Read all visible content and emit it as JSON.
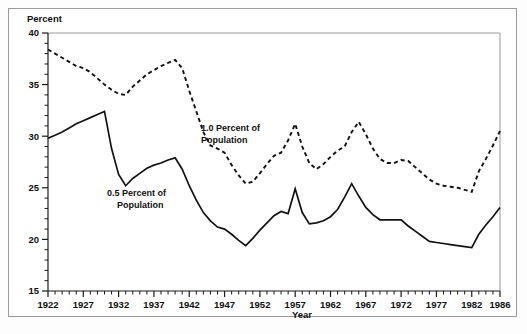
{
  "figure": {
    "y_axis_title": "Percent",
    "x_axis_title": "Year"
  },
  "labels": {
    "series_solid_line1": "0.5 Percent of",
    "series_solid_line2": "Population",
    "series_dashed_line1": "1.0 Percent of",
    "series_dashed_line2": "Population"
  },
  "chart_data": {
    "type": "line",
    "title": "",
    "xlabel": "Year",
    "ylabel": "Percent",
    "xlim": [
      1922,
      1986
    ],
    "ylim": [
      15,
      40
    ],
    "grid": false,
    "legend_position": "inline-annotation",
    "y_ticks": [
      15,
      20,
      25,
      30,
      35,
      40
    ],
    "y_tick_labels": [
      "15",
      "20",
      "25",
      "30",
      "35",
      "40"
    ],
    "y_minor_tick_step": 1,
    "x_ticks": [
      1922,
      1927,
      1932,
      1937,
      1942,
      1947,
      1952,
      1957,
      1962,
      1967,
      1972,
      1977,
      1982,
      1986
    ],
    "x_tick_labels": [
      "1922",
      "1927",
      "1932",
      "1937",
      "1942",
      "1947",
      "1952",
      "1957",
      "1962",
      "1967",
      "1972",
      "1977",
      "1982",
      "1986"
    ],
    "x_minor_tick_step": 1,
    "x": [
      1922,
      1923,
      1924,
      1925,
      1926,
      1927,
      1928,
      1929,
      1930,
      1931,
      1932,
      1933,
      1934,
      1935,
      1936,
      1937,
      1938,
      1939,
      1940,
      1941,
      1942,
      1943,
      1944,
      1945,
      1946,
      1947,
      1948,
      1949,
      1950,
      1951,
      1952,
      1953,
      1954,
      1955,
      1956,
      1957,
      1958,
      1959,
      1960,
      1961,
      1962,
      1963,
      1964,
      1965,
      1966,
      1967,
      1968,
      1969,
      1970,
      1971,
      1972,
      1973,
      1974,
      1975,
      1976,
      1977,
      1978,
      1979,
      1980,
      1981,
      1982,
      1983,
      1984,
      1985,
      1986
    ],
    "series": [
      {
        "name": "1.0 Percent of Population",
        "style": "dashed",
        "values": [
          38.4,
          38.0,
          37.6,
          37.2,
          36.8,
          36.6,
          36.2,
          35.6,
          35.0,
          34.5,
          34.1,
          34.0,
          34.8,
          35.4,
          36.0,
          36.4,
          36.8,
          37.1,
          37.4,
          36.6,
          34.4,
          32.4,
          30.4,
          29.1,
          28.8,
          28.4,
          27.2,
          26.2,
          25.4,
          25.6,
          26.4,
          27.3,
          28.1,
          28.4,
          29.6,
          31.2,
          29.0,
          27.4,
          26.8,
          27.3,
          28.0,
          28.6,
          29.0,
          30.4,
          31.4,
          30.2,
          28.8,
          27.8,
          27.4,
          27.4,
          27.7,
          27.6,
          27.0,
          26.4,
          25.8,
          25.4,
          25.2,
          25.1,
          25.0,
          24.8,
          24.6,
          26.6,
          27.8,
          29.1,
          30.5
        ]
      },
      {
        "name": "0.5 Percent of Population",
        "style": "solid",
        "values": [
          29.8,
          30.1,
          30.4,
          30.8,
          31.2,
          31.5,
          31.8,
          32.1,
          32.4,
          28.8,
          26.3,
          25.2,
          25.9,
          26.4,
          26.9,
          27.2,
          27.4,
          27.7,
          27.9,
          26.8,
          25.2,
          23.8,
          22.6,
          21.8,
          21.2,
          21.0,
          20.5,
          19.9,
          19.4,
          20.1,
          20.9,
          21.6,
          22.3,
          22.7,
          22.5,
          24.9,
          22.6,
          21.5,
          21.6,
          21.8,
          22.2,
          22.9,
          24.1,
          25.4,
          24.2,
          23.1,
          22.4,
          21.9,
          21.9,
          21.9,
          21.9,
          21.3,
          20.8,
          20.3,
          19.8,
          19.7,
          19.6,
          19.5,
          19.4,
          19.3,
          19.2,
          20.5,
          21.4,
          22.2,
          23.1
        ]
      }
    ]
  }
}
